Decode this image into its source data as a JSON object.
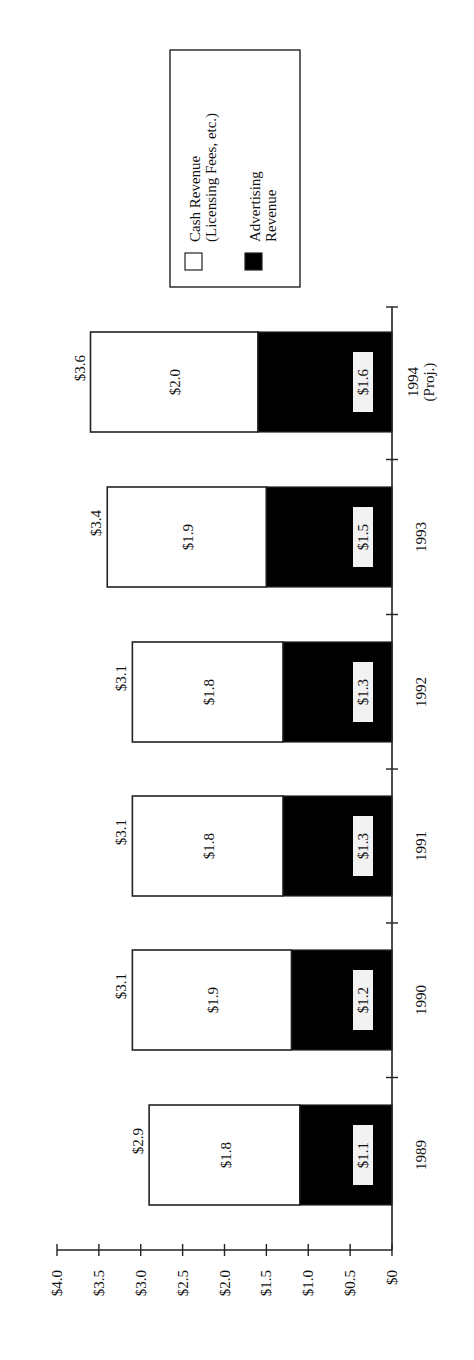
{
  "chart_data": {
    "type": "bar",
    "stacked": true,
    "orientation": "vertical (image rotated 90° counter-clockwise)",
    "title": "",
    "xlabel": "",
    "ylabel": "",
    "ylim": [
      0,
      4.0
    ],
    "y_ticks": [
      "$0",
      "$0.5",
      "$1.0",
      "$1.5",
      "$2.0",
      "$2.5",
      "$3.0",
      "$3.5",
      "$4.0"
    ],
    "categories": [
      "1989",
      "1990",
      "1991",
      "1992",
      "1993",
      "1994 (Proj.)"
    ],
    "category_labels": [
      {
        "line1": "1989",
        "line2": ""
      },
      {
        "line1": "1990",
        "line2": ""
      },
      {
        "line1": "1991",
        "line2": ""
      },
      {
        "line1": "1992",
        "line2": ""
      },
      {
        "line1": "1993",
        "line2": ""
      },
      {
        "line1": "1994",
        "line2": "(Proj.)"
      }
    ],
    "series": [
      {
        "name": "Advertising Revenue",
        "color": "#000000",
        "values": [
          1.1,
          1.2,
          1.3,
          1.3,
          1.5,
          1.6
        ],
        "labels": [
          "$1.1",
          "$1.2",
          "$1.3",
          "$1.3",
          "$1.5",
          "$1.6"
        ]
      },
      {
        "name": "Cash Revenue (Licensing Fees, etc.)",
        "color": "#ffffff",
        "values": [
          1.8,
          1.9,
          1.8,
          1.8,
          1.9,
          2.0
        ],
        "labels": [
          "$1.8",
          "$1.9",
          "$1.8",
          "$1.8",
          "$1.9",
          "$2.0"
        ]
      }
    ],
    "totals": [
      2.9,
      3.1,
      3.1,
      3.1,
      3.4,
      3.6
    ],
    "total_labels": [
      "$2.9",
      "$3.1",
      "$3.1",
      "$3.1",
      "$3.4",
      "$3.6"
    ],
    "legend": {
      "position": "top-right (rotated)",
      "entries": [
        {
          "line1": "Cash Revenue",
          "line2": "(Licensing Fees, etc.)",
          "swatch": "#ffffff"
        },
        {
          "line1": "Advertising",
          "line2": "Revenue",
          "swatch": "#000000"
        }
      ]
    },
    "grid": false
  }
}
